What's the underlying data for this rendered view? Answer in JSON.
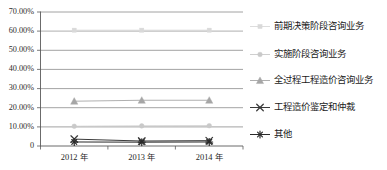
{
  "chart_data": {
    "type": "line",
    "title": "",
    "xlabel": "",
    "ylabel": "",
    "categories": [
      "2012 年",
      "2013 年",
      "2014 年"
    ],
    "ylim": [
      0,
      0.7
    ],
    "y_tick_labels": [
      "0",
      "10.00%",
      "20.00%",
      "30.00%",
      "40.00%",
      "50.00%",
      "60.00%",
      "70.00%"
    ],
    "y_tick_values": [
      0,
      0.1,
      0.2,
      0.3,
      0.4,
      0.5,
      0.6,
      0.7
    ],
    "grid": true,
    "legend_position": "right",
    "series": [
      {
        "name": "前期决策阶段咨询业务",
        "values": [
          0.605,
          0.605,
          0.605
        ],
        "color": "#d9d9d9",
        "marker": "square"
      },
      {
        "name": "实施阶段咨询业务",
        "values": [
          0.103,
          0.105,
          0.106
        ],
        "color": "#c9c9c9",
        "marker": "circle"
      },
      {
        "name": "全过程工程造价咨询业务",
        "values": [
          0.234,
          0.239,
          0.239
        ],
        "color": "#a6a6a6",
        "marker": "triangle"
      },
      {
        "name": "工程造价鉴定和仲裁",
        "values": [
          0.036,
          0.026,
          0.028
        ],
        "color": "#3a3a3a",
        "marker": "x"
      },
      {
        "name": "其他",
        "values": [
          0.021,
          0.02,
          0.021
        ],
        "color": "#2a2a2a",
        "marker": "asterisk"
      }
    ]
  },
  "axes": {
    "y_labels": [
      {
        "text": "70.00%",
        "value": 0.7
      },
      {
        "text": "60.00%",
        "value": 0.6
      },
      {
        "text": "50.00%",
        "value": 0.5
      },
      {
        "text": "40.00%",
        "value": 0.4
      },
      {
        "text": "30.00%",
        "value": 0.3
      },
      {
        "text": "20.00%",
        "value": 0.2
      },
      {
        "text": "10.00%",
        "value": 0.1
      },
      {
        "text": "0",
        "value": 0.0
      }
    ],
    "x_labels": [
      "2012 年",
      "2013 年",
      "2014 年"
    ]
  },
  "legend": {
    "items": [
      {
        "label": "前期决策阶段咨询业务",
        "marker": "square-marker",
        "color": "#d9d9d9"
      },
      {
        "label": "实施阶段咨询业务",
        "marker": "circle-marker",
        "color": "#c9c9c9"
      },
      {
        "label": "全过程工程造价咨询业务",
        "marker": "triangle-marker",
        "color": "#a6a6a6"
      },
      {
        "label": "工程造价鉴定和仲裁",
        "marker": "x-marker",
        "color": "#3a3a3a"
      },
      {
        "label": "其他",
        "marker": "asterisk-marker",
        "color": "#2a2a2a"
      }
    ]
  },
  "colors": {
    "grid": "#8c8c8c",
    "axis": "#5a5a5a",
    "text": "#1a1a1a",
    "background": "#ffffff"
  }
}
